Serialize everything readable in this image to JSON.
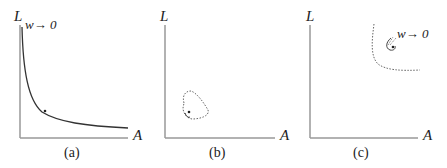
{
  "panels": [
    {
      "id": "a",
      "caption": "(a)",
      "y_label": "L",
      "x_label": "A",
      "annotation": "w→ 0"
    },
    {
      "id": "b",
      "caption": "(b)",
      "y_label": "L",
      "x_label": "A"
    },
    {
      "id": "c",
      "caption": "(c)",
      "y_label": "L",
      "x_label": "A",
      "annotation": "w→ 0"
    }
  ],
  "colors": {
    "axis": "#999999",
    "curve": "#333333"
  }
}
